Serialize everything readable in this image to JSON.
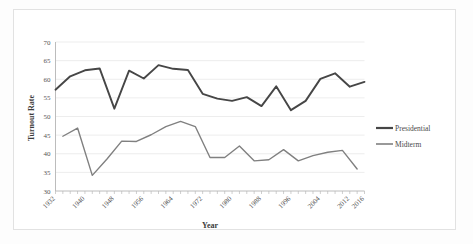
{
  "chart_data": {
    "type": "line",
    "title": "",
    "xlabel": "Year",
    "ylabel": "Turnout Rate",
    "ylim": [
      30,
      70
    ],
    "ytick_step": 5,
    "yticks": [
      30,
      35,
      40,
      45,
      50,
      55,
      60,
      65,
      70
    ],
    "xlim": [
      1932,
      2016
    ],
    "xticks": [
      1932,
      1940,
      1948,
      1956,
      1964,
      1972,
      1980,
      1988,
      1996,
      2004,
      2012,
      2016
    ],
    "grid": "horizontal",
    "legend_position": "right",
    "series": [
      {
        "name": "Presidential",
        "color": "#464646",
        "stroke_width": 1.9,
        "x": [
          1932,
          1936,
          1940,
          1944,
          1948,
          1952,
          1956,
          1960,
          1964,
          1968,
          1972,
          1976,
          1980,
          1984,
          1988,
          1992,
          1996,
          2000,
          2004,
          2008,
          2012,
          2016
        ],
        "values": [
          57.2,
          60.8,
          62.4,
          62.9,
          52.1,
          62.3,
          60.2,
          63.8,
          62.8,
          62.5,
          56.1,
          54.8,
          54.2,
          55.2,
          52.8,
          58.1,
          51.7,
          54.2,
          60.1,
          61.6,
          58.0,
          59.3
        ]
      },
      {
        "name": "Midterm",
        "color": "#808080",
        "stroke_width": 1.4,
        "x": [
          1934,
          1938,
          1942,
          1946,
          1950,
          1954,
          1958,
          1962,
          1966,
          1970,
          1974,
          1978,
          1982,
          1986,
          1990,
          1994,
          1998,
          2002,
          2006,
          2010,
          2014
        ],
        "values": [
          44.7,
          46.9,
          34.2,
          38.6,
          43.4,
          43.3,
          45.1,
          47.3,
          48.7,
          47.3,
          39.0,
          39.0,
          42.1,
          38.1,
          38.4,
          41.1,
          38.1,
          39.5,
          40.4,
          40.9,
          35.9
        ]
      }
    ]
  },
  "legend": {
    "items": [
      {
        "label": "Presidential",
        "color": "#464646"
      },
      {
        "label": "Midterm",
        "color": "#808080"
      }
    ]
  },
  "axes": {
    "y_title": "Turnout Rate",
    "x_title": "Year"
  }
}
